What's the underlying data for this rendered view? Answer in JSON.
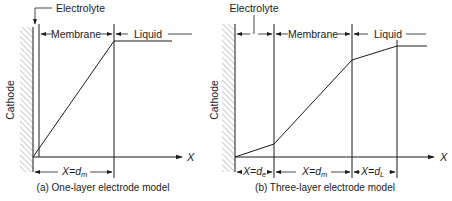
{
  "figure": {
    "panels": [
      {
        "id": "a",
        "caption": "(a) One-layer electrode model",
        "wall_label": "Cathode",
        "region_labels": {
          "electrolyte": "Electrolyte",
          "membrane": "Membrane",
          "liquid": "Liquid"
        },
        "axis_label": "X",
        "dimensions": [
          {
            "text": "X=d",
            "subscript": "m"
          }
        ],
        "profile_points": [
          [
            33,
            157
          ],
          [
            114,
            41
          ],
          [
            172,
            41
          ]
        ]
      },
      {
        "id": "b",
        "caption": "(b) Three-layer electrode model",
        "wall_label": "Cathode",
        "region_labels": {
          "electrolyte": "Electrolyte",
          "membrane": "Membrane",
          "liquid": "Liquid"
        },
        "axis_label": "X",
        "dimensions": [
          {
            "text": "X=d",
            "subscript": "e"
          },
          {
            "text": "X=d",
            "subscript": "m"
          },
          {
            "text": "X=d",
            "subscript": "L"
          }
        ],
        "profile_points": [
          [
            235,
            157
          ],
          [
            274,
            144
          ],
          [
            352,
            60
          ],
          [
            397,
            46
          ],
          [
            427,
            46
          ]
        ]
      }
    ]
  }
}
